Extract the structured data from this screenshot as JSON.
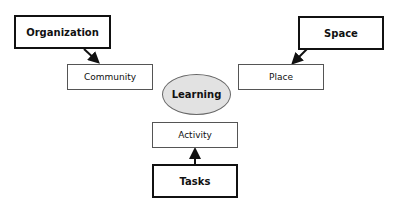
{
  "diagram": {
    "center": {
      "label": "Learning",
      "fill": "#e2e2e2"
    },
    "drivers": [
      {
        "label": "Organization"
      },
      {
        "label": "Space"
      },
      {
        "label": "Tasks"
      }
    ],
    "elements": [
      {
        "label": "Community"
      },
      {
        "label": "Place"
      },
      {
        "label": "Activity"
      }
    ],
    "edges": [
      {
        "from": "Organization",
        "to": "Community"
      },
      {
        "from": "Space",
        "to": "Place"
      },
      {
        "from": "Tasks",
        "to": "Activity"
      }
    ]
  }
}
